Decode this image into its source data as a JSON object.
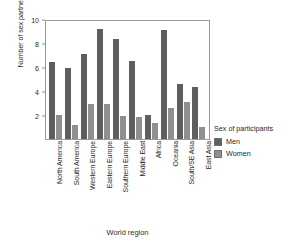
{
  "chart_data": {
    "type": "bar",
    "title": "",
    "xlabel": "World region",
    "ylabel": "Number of sex partners desired",
    "ylim": [
      0,
      10
    ],
    "yticks": [
      2,
      4,
      6,
      8,
      10
    ],
    "grid": false,
    "legend_position": "right",
    "legend_title": "Sex of participants",
    "categories": [
      "North America",
      "South America",
      "Western Europe",
      "Eastern Europe",
      "Southern Europe",
      "Middle East",
      "Africa",
      "Oceania",
      "South/SE Asia",
      "East Asia"
    ],
    "series": [
      {
        "name": "Men",
        "color": "#5e5e5e",
        "values": [
          6.4,
          5.9,
          7.1,
          9.2,
          8.3,
          6.5,
          2.0,
          9.1,
          4.6,
          4.3
        ]
      },
      {
        "name": "Women",
        "color": "#8f8f8f",
        "values": [
          2.0,
          1.2,
          2.9,
          2.9,
          1.9,
          1.8,
          1.3,
          2.6,
          3.1,
          1.0
        ]
      }
    ]
  },
  "legend": {
    "title": "Sex of participants",
    "entries": [
      {
        "label": "Men",
        "color": "#5e5e5e"
      },
      {
        "label": "Women",
        "color": "#8f8f8f"
      }
    ]
  },
  "axes": {
    "y_title": "Number of sex partners desired",
    "x_title": "World region",
    "y_tick_labels": [
      "2",
      "4",
      "6",
      "8",
      "10"
    ]
  }
}
